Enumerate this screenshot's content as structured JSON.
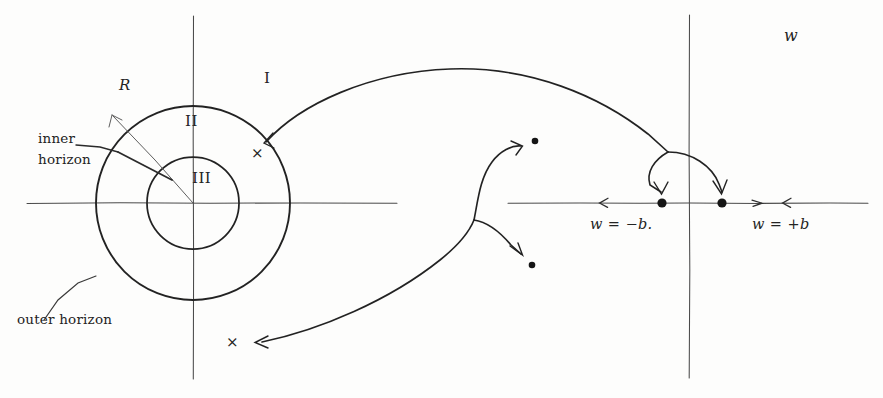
{
  "figure": {
    "title_mark": "w",
    "regions": {
      "region_outer": "I",
      "region_middle": "II",
      "region_inner": "III"
    },
    "annotations": {
      "radius_label": "R",
      "inner_horizon_line1": "inner",
      "inner_horizon_line2": "horizon",
      "outer_horizon": "outer horizon",
      "cross_mark_upper": "×",
      "cross_mark_lower": "×",
      "axis_label_negative": "w = −b.",
      "axis_label_positive": "w = +b"
    },
    "colors": {
      "ink": "#232323",
      "axis": "#4a4a4a",
      "paper": "#fdfdfc"
    },
    "geometry": {
      "center_x": 193,
      "center_y": 203,
      "outer_radius": 97,
      "inner_radius": 46,
      "left_vertical_axis_x": 193,
      "right_vertical_axis_x": 689,
      "horizontal_axis_y": 203,
      "branch_point_x": 668,
      "branch_point_y": 152,
      "dot_minus_b_x": 662,
      "dot_plus_b_y": 203,
      "dot_plus_b_x": 722,
      "dot_upper_x": 535,
      "dot_upper_y": 142,
      "dot_lower_x": 532,
      "dot_lower_y": 265
    }
  }
}
